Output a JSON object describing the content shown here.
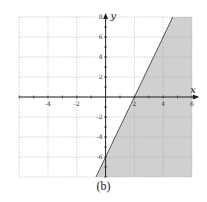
{
  "chart_data": {
    "type": "area",
    "title": "",
    "caption": "(b)",
    "xlabel": "x",
    "ylabel": "y",
    "xlim": [
      -6,
      6
    ],
    "ylim": [
      -8,
      8
    ],
    "grid": true,
    "grid_style": "dotted",
    "x_ticks": [
      -6,
      -4,
      -2,
      0,
      2,
      4,
      6
    ],
    "x_tick_labels": [
      "-4",
      "-2",
      "2",
      "4",
      "6"
    ],
    "x_tick_label_values": [
      -4,
      -2,
      2,
      4,
      6
    ],
    "y_ticks": [
      -8,
      -6,
      -4,
      -2,
      0,
      2,
      4,
      6,
      8
    ],
    "y_tick_labels": [
      "8",
      "6",
      "4",
      "2",
      "-2",
      "-4",
      "-6"
    ],
    "y_tick_label_values": [
      8,
      6,
      4,
      2,
      -2,
      -4,
      -6
    ],
    "boundary_line": {
      "equation": "y = 3x - 6",
      "slope": 3,
      "intercept": -6,
      "points": [
        [
          2,
          0
        ],
        [
          0,
          -6
        ]
      ],
      "style": "solid"
    },
    "shaded_region": {
      "inequality": "y <= 3x - 6",
      "side": "right/below line",
      "color": "#d0d0d0"
    },
    "legend": null
  },
  "caption": "(b)",
  "colors": {
    "shade": "#d0d0d0",
    "axis": "#222222",
    "grid": "#9a9a9a",
    "line": "#555555"
  }
}
